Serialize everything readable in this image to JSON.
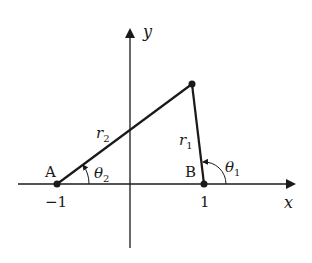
{
  "diagram": {
    "axes": {
      "x_label": "x",
      "y_label": "y",
      "tick_neg": "−1",
      "tick_pos": "1"
    },
    "points": {
      "A": {
        "label": "A",
        "coord": -1
      },
      "B": {
        "label": "B",
        "coord": 1
      }
    },
    "segments": {
      "r1": {
        "base": "r",
        "sub": "1"
      },
      "r2": {
        "base": "r",
        "sub": "2"
      }
    },
    "angles": {
      "theta1": {
        "base": "θ",
        "sub": "1"
      },
      "theta2": {
        "base": "θ",
        "sub": "2"
      }
    },
    "colors": {
      "ink": "#1a1a1a",
      "background": "#ffffff"
    }
  }
}
